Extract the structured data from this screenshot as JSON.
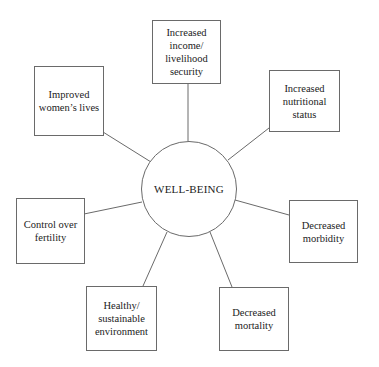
{
  "diagram": {
    "type": "hub-and-spoke",
    "center": {
      "label": "WELL-BEING"
    },
    "nodes": [
      {
        "id": "income",
        "label": "Increased\nincome/\nlivelihood\nsecurity"
      },
      {
        "id": "nutrition",
        "label": "Increased\nnutritional\nstatus"
      },
      {
        "id": "morbidity",
        "label": "Decreased\nmorbidity"
      },
      {
        "id": "mortality",
        "label": "Decreased\nmortality"
      },
      {
        "id": "environment",
        "label": "Healthy/\nsustainable\nenvironment"
      },
      {
        "id": "fertility",
        "label": "Control over\nfertility"
      },
      {
        "id": "women",
        "label": "Improved\nwomen’s lives"
      }
    ],
    "colors": {
      "line": "#6a6a6a",
      "text": "#222222",
      "background": "#ffffff"
    }
  }
}
